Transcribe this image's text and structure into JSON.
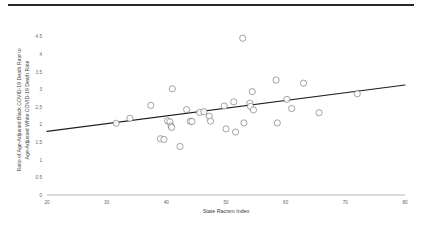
{
  "figure": {
    "background_color": "#ffffff",
    "rule_color": "#262626",
    "marker_stroke_color": "#5a5a5a",
    "trend_color": "#1f1f1f",
    "axis_color": "#9a9a9a"
  },
  "chart_data": {
    "type": "scatter",
    "title": "",
    "subtitle": "",
    "xlabel": "State Racism Index",
    "ylabel": "Ratio of Age-Adjusted Black COVID-19 Death Rate to Age-Adjusted White COVID-19 Death Rate",
    "ylabel_lines": [
      "Ratio of Age-Adjusted Black COVID-19 Death Rate to",
      "Age-Adjusted White COVID-19 Death Rate"
    ],
    "xlim": [
      20,
      80
    ],
    "ylim": [
      0,
      4.75
    ],
    "xticks": [
      20,
      30,
      40,
      50,
      60,
      70,
      80
    ],
    "xtick_labels": [
      "20",
      "30",
      "40",
      "50",
      "60",
      "70",
      "80"
    ],
    "yticks": [
      0,
      0.5,
      1,
      1.5,
      2,
      2.5,
      3,
      3.5,
      4,
      4.5
    ],
    "ytick_labels": [
      "0",
      "0.5",
      "1",
      "1.5",
      "2",
      "2.5",
      "3",
      "3.5",
      "4",
      "4.5"
    ],
    "grid": false,
    "legend": "none",
    "legend_position": "none",
    "marker_shape": "circle-with-label",
    "marker_labels_legible": false,
    "points": [
      {
        "x": 31.6,
        "y": 2.04,
        "label": ""
      },
      {
        "x": 33.9,
        "y": 2.18,
        "label": ""
      },
      {
        "x": 37.4,
        "y": 2.55,
        "label": ""
      },
      {
        "x": 39.0,
        "y": 1.6,
        "label": ""
      },
      {
        "x": 39.6,
        "y": 1.58,
        "label": ""
      },
      {
        "x": 40.2,
        "y": 2.11,
        "label": ""
      },
      {
        "x": 40.6,
        "y": 2.08,
        "label": ""
      },
      {
        "x": 40.8,
        "y": 1.96,
        "label": ""
      },
      {
        "x": 40.9,
        "y": 1.92,
        "label": ""
      },
      {
        "x": 41.0,
        "y": 3.02,
        "label": ""
      },
      {
        "x": 42.3,
        "y": 1.38,
        "label": ""
      },
      {
        "x": 43.4,
        "y": 2.43,
        "label": ""
      },
      {
        "x": 44.0,
        "y": 2.1,
        "label": ""
      },
      {
        "x": 44.3,
        "y": 2.09,
        "label": ""
      },
      {
        "x": 45.6,
        "y": 2.35,
        "label": ""
      },
      {
        "x": 46.3,
        "y": 2.37,
        "label": ""
      },
      {
        "x": 47.2,
        "y": 2.24,
        "label": ""
      },
      {
        "x": 47.4,
        "y": 2.1,
        "label": ""
      },
      {
        "x": 49.7,
        "y": 2.53,
        "label": ""
      },
      {
        "x": 50.0,
        "y": 1.88,
        "label": ""
      },
      {
        "x": 51.3,
        "y": 2.65,
        "label": ""
      },
      {
        "x": 51.6,
        "y": 1.79,
        "label": ""
      },
      {
        "x": 52.8,
        "y": 4.46,
        "label": ""
      },
      {
        "x": 53.0,
        "y": 2.05,
        "label": ""
      },
      {
        "x": 54.4,
        "y": 2.94,
        "label": ""
      },
      {
        "x": 54.0,
        "y": 2.61,
        "label": ""
      },
      {
        "x": 54.1,
        "y": 2.52,
        "label": ""
      },
      {
        "x": 54.6,
        "y": 2.42,
        "label": ""
      },
      {
        "x": 58.4,
        "y": 3.27,
        "label": ""
      },
      {
        "x": 58.6,
        "y": 2.05,
        "label": ""
      },
      {
        "x": 60.2,
        "y": 2.72,
        "label": ""
      },
      {
        "x": 61.0,
        "y": 2.46,
        "label": ""
      },
      {
        "x": 63.0,
        "y": 3.18,
        "label": ""
      },
      {
        "x": 65.6,
        "y": 2.34,
        "label": ""
      },
      {
        "x": 72.0,
        "y": 2.88,
        "label": ""
      }
    ],
    "trendline": {
      "type": "linear",
      "x_start": 20.0,
      "y_start": 1.81,
      "x_end": 80.0,
      "y_end": 3.13
    }
  }
}
